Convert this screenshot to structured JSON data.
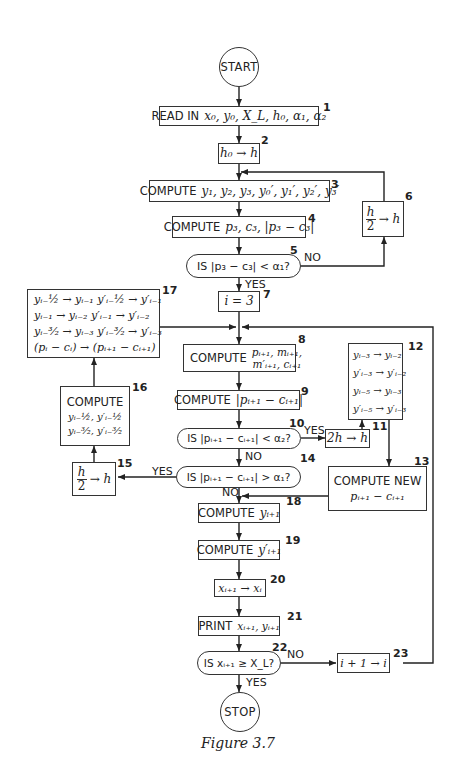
{
  "figure": {
    "caption": "Figure 3.7",
    "nodes": {
      "start": {
        "label": "START"
      },
      "n1": {
        "num": "1",
        "keyword": "READ IN",
        "expr": "x₀, y₀, X_L, h₀, α₁, α₂"
      },
      "n2": {
        "num": "2",
        "expr": "h₀ → h"
      },
      "n3": {
        "num": "3",
        "keyword": "COMPUTE",
        "expr": "y₁, y₂, y₃, y₀′, y₁′, y₂′, y₃′"
      },
      "n4": {
        "num": "4",
        "keyword": "COMPUTE",
        "expr": "p₃, c₃, |p₃ − c₃|"
      },
      "n5": {
        "num": "5",
        "text": "IS |p₃ − c₃| < α₁?",
        "no_label": "NO",
        "yes_label": "YES"
      },
      "n6": {
        "num": "6",
        "numerator": "h",
        "denominator": "2",
        "expr": "→ h"
      },
      "n7": {
        "num": "7",
        "expr": "i = 3"
      },
      "n8": {
        "num": "8",
        "keyword": "COMPUTE",
        "line1": "pᵢ₊₁, mᵢ₊₁,",
        "line2": "m′ᵢ₊₁, cᵢ₊₁"
      },
      "n9": {
        "num": "9",
        "keyword": "COMPUTE",
        "expr": "|pᵢ₊₁ − cᵢ₊₁|"
      },
      "n10": {
        "num": "10",
        "text": "IS |pᵢ₊₁ − cᵢ₊₁| < α₂?",
        "yes_label": "YES",
        "no_label": "NO"
      },
      "n11": {
        "num": "11",
        "expr": "2h → h"
      },
      "n12": {
        "num": "12",
        "lines": [
          "yᵢ₋₃ → yᵢ₋₂",
          "y′ᵢ₋₃ → y′ᵢ₋₂",
          "yᵢ₋₅ → yᵢ₋₃",
          "y′ᵢ₋₅ → y′ᵢ₋₃"
        ]
      },
      "n13": {
        "num": "13",
        "keyword": "COMPUTE NEW",
        "expr": "pᵢ₊₁ − cᵢ₊₁"
      },
      "n14": {
        "num": "14",
        "text": "IS |pᵢ₊₁ − cᵢ₊₁| > α₁?",
        "yes_label": "YES",
        "no_label": "NO"
      },
      "n15": {
        "num": "15",
        "numerator": "h",
        "denominator": "2",
        "expr": "→ h"
      },
      "n16": {
        "num": "16",
        "keyword": "COMPUTE",
        "line1": "yᵢ₋½, y′ᵢ₋½",
        "line2": "yᵢ₋³⁄₂, y′ᵢ₋³⁄₂"
      },
      "n17": {
        "num": "17",
        "lines": [
          "yᵢ₋½ → yᵢ₋₁    y′ᵢ₋½ → y′ᵢ₋₁",
          "yᵢ₋₁ → yᵢ₋₂    y′ᵢ₋₁ → y′ᵢ₋₂",
          "yᵢ₋³⁄₂ → yᵢ₋₃    y′ᵢ₋³⁄₂ → y′ᵢ₋₃",
          "(pᵢ − cᵢ) → (pᵢ₊₁ − cᵢ₊₁)"
        ]
      },
      "n18": {
        "num": "18",
        "keyword": "COMPUTE",
        "expr": "yᵢ₊₁"
      },
      "n19": {
        "num": "19",
        "keyword": "COMPUTE",
        "expr": "y′ᵢ₊₁"
      },
      "n20": {
        "num": "20",
        "expr": "xᵢ₊₁ → xᵢ"
      },
      "n21": {
        "num": "21",
        "keyword": "PRINT",
        "expr": "xᵢ₊₁, yᵢ₊₁"
      },
      "n22": {
        "num": "22",
        "text": "IS xᵢ₊₁ ≥ X_L?",
        "no_label": "NO",
        "yes_label": "YES"
      },
      "n23": {
        "num": "23",
        "expr": "i + 1 → i"
      },
      "stop": {
        "label": "STOP"
      }
    }
  }
}
